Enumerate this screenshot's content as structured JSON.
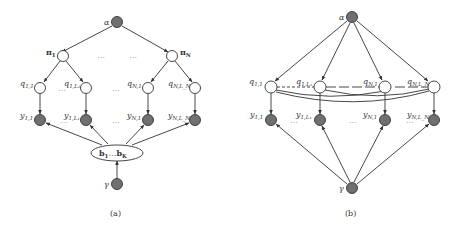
{
  "panel_a": {
    "caption": "(a)",
    "nodes": {
      "alpha": {
        "label": "α",
        "type": "observed"
      },
      "pi_1": {
        "label": "π",
        "sub": "1",
        "type": "latent"
      },
      "pi_N": {
        "label": "π",
        "sub": "N",
        "type": "latent"
      },
      "q_11": {
        "label": "q",
        "sub": "1,1",
        "type": "latent"
      },
      "q_1L1": {
        "label": "q",
        "sub": "1,L₁",
        "type": "latent"
      },
      "q_N1": {
        "label": "q",
        "sub": "N,1",
        "type": "latent"
      },
      "q_NLN": {
        "label": "q",
        "sub": "N,L_N",
        "type": "latent"
      },
      "y_11": {
        "label": "y",
        "sub": "1,1",
        "type": "observed"
      },
      "y_1L1": {
        "label": "y",
        "sub": "1,L₁",
        "type": "observed"
      },
      "y_N1": {
        "label": "y",
        "sub": "N,1",
        "type": "observed"
      },
      "y_NLN": {
        "label": "y",
        "sub": "N,L_N",
        "type": "observed"
      },
      "b": {
        "label_start": "b",
        "sub_start": "1",
        "ellipsis": "…",
        "label_end": "b",
        "sub_end": "K",
        "type": "latent-group"
      },
      "gamma": {
        "label": "γ",
        "type": "observed"
      }
    },
    "ellipsis": "…",
    "edges": [
      [
        "alpha",
        "pi_1"
      ],
      [
        "alpha",
        "pi_N"
      ],
      [
        "pi_1",
        "q_11"
      ],
      [
        "pi_1",
        "q_1L1"
      ],
      [
        "pi_N",
        "q_N1"
      ],
      [
        "pi_N",
        "q_NLN"
      ],
      [
        "q_11",
        "y_11"
      ],
      [
        "q_1L1",
        "y_1L1"
      ],
      [
        "q_N1",
        "y_N1"
      ],
      [
        "q_NLN",
        "y_NLN"
      ],
      [
        "b",
        "y_11"
      ],
      [
        "b",
        "y_1L1"
      ],
      [
        "b",
        "y_N1"
      ],
      [
        "b",
        "y_NLN"
      ],
      [
        "gamma",
        "b"
      ]
    ]
  },
  "panel_b": {
    "caption": "(b)",
    "nodes": {
      "alpha": {
        "label": "α",
        "type": "observed"
      },
      "q_11": {
        "label": "q",
        "sub": "1,1",
        "type": "latent"
      },
      "q_1L1": {
        "label": "q",
        "sub": "1,L₁",
        "type": "latent"
      },
      "q_N1": {
        "label": "q",
        "sub": "N,1",
        "type": "latent"
      },
      "q_NLN": {
        "label": "q",
        "sub": "N,L_N",
        "type": "latent"
      },
      "y_11": {
        "label": "y",
        "sub": "1,1",
        "type": "observed"
      },
      "y_1L1": {
        "label": "y",
        "sub": "1,L₁",
        "type": "observed"
      },
      "y_N1": {
        "label": "y",
        "sub": "N,1",
        "type": "observed"
      },
      "y_NLN": {
        "label": "y",
        "sub": "N,L_N",
        "type": "observed"
      },
      "gamma": {
        "label": "γ",
        "type": "observed"
      }
    },
    "ellipsis": "…",
    "edges": [
      [
        "alpha",
        "q_11"
      ],
      [
        "alpha",
        "q_1L1"
      ],
      [
        "alpha",
        "q_N1"
      ],
      [
        "alpha",
        "q_NLN"
      ],
      [
        "q_11",
        "y_11"
      ],
      [
        "q_1L1",
        "y_1L1"
      ],
      [
        "q_N1",
        "y_N1"
      ],
      [
        "q_NLN",
        "y_NLN"
      ],
      [
        "gamma",
        "y_11"
      ],
      [
        "gamma",
        "y_1L1"
      ],
      [
        "gamma",
        "y_N1"
      ],
      [
        "gamma",
        "y_NLN"
      ]
    ],
    "undirected_edges": [
      [
        "q_11",
        "q_1L1"
      ],
      [
        "q_11",
        "q_N1"
      ],
      [
        "q_11",
        "q_NLN"
      ],
      [
        "q_1L1",
        "q_N1"
      ],
      [
        "q_1L1",
        "q_NLN"
      ],
      [
        "q_N1",
        "q_NLN"
      ]
    ]
  }
}
